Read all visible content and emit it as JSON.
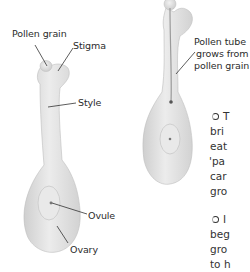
{
  "diagram": {
    "left_carpel": {
      "labels": {
        "pollen_grain": "Pollen grain",
        "stigma": "Stigma",
        "style": "Style",
        "ovule": "Ovule",
        "ovary": "Ovary"
      }
    },
    "right_carpel": {
      "labels": {
        "pollen_tube_line1": "Pollen tube",
        "pollen_tube_line2": "grows from",
        "pollen_tube_line3": "pollen grain"
      }
    },
    "colors": {
      "carpel_fill": "#e6e6e6",
      "carpel_shade": "#c9c9c9",
      "leader_line": "#333333",
      "text": "#2b2b2b"
    }
  },
  "side_text": {
    "paragraph1": [
      "T",
      "bri",
      "eat",
      "'pa",
      "car",
      "gro"
    ],
    "paragraph2": [
      "I",
      "beg",
      "gro",
      "to h"
    ]
  }
}
